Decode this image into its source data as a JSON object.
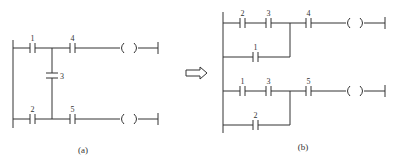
{
  "diagram": {
    "type": "plc-ladder-diagram-transformation",
    "colors": {
      "line": "#333333",
      "background": "#ffffff"
    },
    "panel_a": {
      "caption": "(a)",
      "rungs": [
        {
          "contacts": [
            "1",
            "4"
          ],
          "output": "coil"
        },
        {
          "contacts": [
            "2",
            "5"
          ],
          "output": "coil"
        }
      ],
      "bridge_contact": "3"
    },
    "arrow": {
      "icon": "hollow-right-arrow"
    },
    "panel_b": {
      "caption": "(b)",
      "rungs": [
        {
          "series": [
            "2",
            "3"
          ],
          "parallel_branch": [
            "1"
          ],
          "then": "4",
          "output": "coil"
        },
        {
          "series": [
            "1",
            "3"
          ],
          "parallel_branch": [
            "2"
          ],
          "then": "5",
          "output": "coil"
        }
      ]
    },
    "labels": {
      "a_c1": "1",
      "a_c4": "4",
      "a_c3": "3",
      "a_c2": "2",
      "a_c5": "5",
      "b_r1_c2": "2",
      "b_r1_c3": "3",
      "b_r1_c4": "4",
      "b_r1_br1": "1",
      "b_r2_c1": "1",
      "b_r2_c3": "3",
      "b_r2_c5": "5",
      "b_r2_br2": "2"
    }
  }
}
